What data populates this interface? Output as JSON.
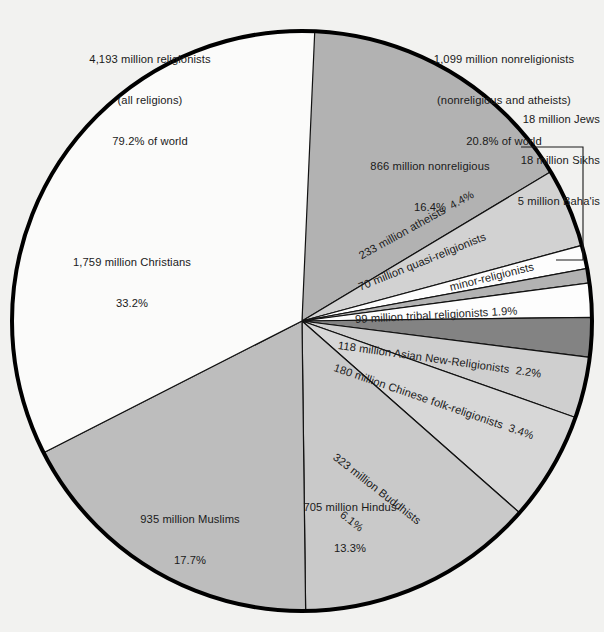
{
  "figure": {
    "background_color": "#f2f2f0",
    "outline_color": "#000000"
  },
  "annotations": {
    "religionists": {
      "line1": "4,193 million religionists",
      "line2": "(all religions)",
      "line3": "79.2% of world"
    },
    "nonreligionists": {
      "line1": "1,099 million nonreligionists",
      "line2": "(nonreligious and atheists)",
      "line3": "20.8% of world"
    },
    "bracket_group": {
      "line1": "18 million Jews",
      "line2": "18 million Sikhs",
      "line3": "5 million Baha'is"
    }
  },
  "chart_data": {
    "type": "pie",
    "title": "",
    "subtitle": "",
    "total_label": "World population by religion (millions)",
    "start_angle_deg": 0,
    "direction": "clockwise",
    "legend_position": "none",
    "grid": false,
    "units": "million adherents",
    "slices": [
      {
        "name": "nonreligious",
        "label_line1": "866 million nonreligious",
        "label_line2": "16.4%",
        "value": 866,
        "percent": 16.4,
        "color": "#b2b2b2",
        "label_style": "horizontal"
      },
      {
        "name": "atheists",
        "label_line1": "233 million atheists  4.4%",
        "label_line2": "",
        "value": 233,
        "percent": 4.4,
        "color": "#d2d2d2",
        "label_style": "rotated"
      },
      {
        "name": "quasi-religionists",
        "label_line1": "70 million quasi-religionists",
        "label_line2": "",
        "value": 70,
        "percent": 1.3,
        "color": "#fdfdfd",
        "label_style": "rotated"
      },
      {
        "name": "minor-religionists",
        "label_line1": "minor-religionists",
        "label_line2": "",
        "value": 41,
        "percent": 0.8,
        "color": "#b2b2b2",
        "label_style": "rotated"
      },
      {
        "name": "tribal religionists",
        "label_line1": "99 million tribal religionists 1.9%",
        "label_line2": "",
        "value": 99,
        "percent": 1.9,
        "color": "#fdfdfd",
        "label_style": "rotated"
      },
      {
        "name": "Asian New-Religionists",
        "label_line1": "118 million Asian New-Religionists  2.2%",
        "label_line2": "",
        "value": 118,
        "percent": 2.2,
        "color": "#838383",
        "label_style": "rotated"
      },
      {
        "name": "Chinese folk-religionists",
        "label_line1": "180 million Chinese folk-religionists  3.4%",
        "label_line2": "",
        "value": 180,
        "percent": 3.4,
        "color": "#cfcfcf",
        "label_style": "rotated"
      },
      {
        "name": "Buddhists",
        "label_line1": "323 million Buddhists",
        "label_line2": "6.1%",
        "value": 323,
        "percent": 6.1,
        "color": "#d7d7d7",
        "label_style": "rotated"
      },
      {
        "name": "Hindus",
        "label_line1": "705 million Hindus",
        "label_line2": "13.3%",
        "value": 705,
        "percent": 13.3,
        "color": "#c9c9c9",
        "label_style": "horizontal"
      },
      {
        "name": "Muslims",
        "label_line1": "935 million Muslims",
        "label_line2": "17.7%",
        "value": 935,
        "percent": 17.7,
        "color": "#bdbdbd",
        "label_style": "horizontal"
      },
      {
        "name": "Christians",
        "label_line1": "1,759 million Christians",
        "label_line2": "33.2%",
        "value": 1759,
        "percent": 33.2,
        "color": "#fbfbfa",
        "label_style": "horizontal"
      }
    ]
  }
}
